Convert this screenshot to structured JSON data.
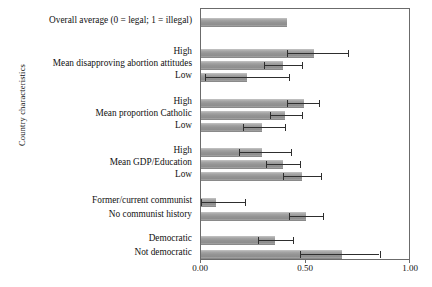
{
  "chart_data": {
    "type": "bar",
    "orientation": "horizontal",
    "title": "",
    "xlabel": "",
    "ylabel": "Country characteristics",
    "xlim": [
      0.0,
      1.0
    ],
    "xticks": [
      "0.00",
      "0.50",
      "1.00"
    ],
    "xtick_values": [
      0.0,
      0.5,
      1.0
    ],
    "grid": false,
    "legend": null,
    "bar_color": "#9a9a9a",
    "error_bar_color": "#2e2e2e",
    "frame_color": "#6b6b6b",
    "categories": [
      "Overall average (0 = legal; 1 = illegal)",
      "High",
      "Mean disapproving abortion attitudes",
      "Low",
      "High",
      "Mean proportion Catholic",
      "Low",
      "High",
      "Mean GDP/Education",
      "Low",
      "Former/current communist",
      "No communist history",
      "Democratic",
      "Not democratic"
    ],
    "values": [
      0.41,
      0.54,
      0.39,
      0.22,
      0.49,
      0.4,
      0.29,
      0.29,
      0.39,
      0.48,
      0.07,
      0.5,
      0.35,
      0.67
    ],
    "error_low": [
      null,
      0.41,
      0.3,
      0.02,
      0.41,
      0.33,
      0.2,
      0.18,
      0.31,
      0.39,
      0.0,
      0.42,
      0.27,
      0.47
    ],
    "error_high": [
      null,
      0.7,
      0.48,
      0.42,
      0.56,
      0.48,
      0.4,
      0.43,
      0.47,
      0.57,
      0.21,
      0.58,
      0.44,
      0.85
    ],
    "groups": [
      {
        "name": "Overall",
        "rows": [
          0
        ]
      },
      {
        "name": "Mean disapproving abortion attitudes",
        "rows": [
          1,
          2,
          3
        ]
      },
      {
        "name": "Mean proportion Catholic",
        "rows": [
          4,
          5,
          6
        ]
      },
      {
        "name": "Mean GDP/Education",
        "rows": [
          7,
          8,
          9
        ]
      },
      {
        "name": "Communist history",
        "rows": [
          10,
          11
        ]
      },
      {
        "name": "Democracy",
        "rows": [
          12,
          13
        ]
      }
    ],
    "row_y": [
      13,
      44,
      56,
      68,
      94,
      106,
      118,
      143,
      155,
      167,
      193,
      207,
      231,
      245
    ]
  }
}
